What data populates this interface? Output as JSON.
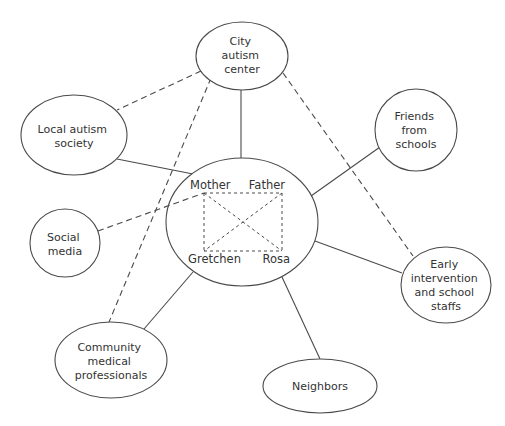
{
  "diagram": {
    "type": "ecomap",
    "center": {
      "id": "family",
      "members": {
        "top_left": "Mother",
        "top_right": "Father",
        "bottom_left": "Gretchen",
        "bottom_right": "Rosa"
      }
    },
    "nodes": {
      "city": {
        "lines": [
          "City",
          "autism",
          "center"
        ]
      },
      "local": {
        "lines": [
          "Local autism",
          "society"
        ]
      },
      "friends": {
        "lines": [
          "Friends",
          "from",
          "schools"
        ]
      },
      "social": {
        "lines": [
          "Social",
          "media"
        ]
      },
      "early": {
        "lines": [
          "Early",
          "intervention",
          "and school",
          "staffs"
        ]
      },
      "community": {
        "lines": [
          "Community",
          "medical",
          "professionals"
        ]
      },
      "neighbors": {
        "lines": [
          "Neighbors"
        ]
      }
    },
    "edges": [
      {
        "from": "city",
        "to": "family",
        "style": "solid"
      },
      {
        "from": "local",
        "to": "family",
        "style": "solid"
      },
      {
        "from": "friends",
        "to": "family",
        "style": "solid"
      },
      {
        "from": "early",
        "to": "family",
        "style": "solid"
      },
      {
        "from": "community",
        "to": "family",
        "style": "solid"
      },
      {
        "from": "neighbors",
        "to": "family",
        "style": "solid"
      },
      {
        "from": "social",
        "to": "Mother",
        "style": "dashed"
      },
      {
        "from": "city",
        "to": "local",
        "style": "dashed"
      },
      {
        "from": "city",
        "to": "community",
        "style": "dashed"
      },
      {
        "from": "city",
        "to": "early",
        "style": "dashed"
      },
      {
        "from": "Mother",
        "to": "Father",
        "style": "dotted"
      },
      {
        "from": "Mother",
        "to": "Gretchen",
        "style": "dotted"
      },
      {
        "from": "Mother",
        "to": "Rosa",
        "style": "dotted"
      },
      {
        "from": "Father",
        "to": "Gretchen",
        "style": "dotted"
      },
      {
        "from": "Father",
        "to": "Rosa",
        "style": "dotted"
      },
      {
        "from": "Gretchen",
        "to": "Rosa",
        "style": "dotted"
      }
    ],
    "colors": {
      "stroke": "#4a4a4a",
      "text": "#333333",
      "background": "#ffffff"
    }
  }
}
